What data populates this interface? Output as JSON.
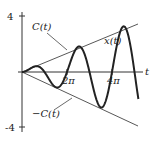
{
  "chart_data": {
    "type": "line",
    "title": "",
    "xlabel": "t",
    "ylabel": "",
    "xlim": [
      0,
      16.3
    ],
    "ylim": [
      -4,
      4
    ],
    "x_ticks": [
      {
        "value": 6.2832,
        "label": "2π"
      },
      {
        "value": 12.5664,
        "label": "4π"
      }
    ],
    "y_ticks": [
      {
        "value": 4,
        "label": "4"
      },
      {
        "value": -4,
        "label": "-4"
      }
    ],
    "grid": false,
    "legend": null,
    "series": [
      {
        "name": "x(t)",
        "formula": "x(t) = 0.23 t sin(t)",
        "style": "thick solid"
      },
      {
        "name": "C(t)",
        "formula": "C(t) = 0.23 t",
        "style": "thin solid"
      },
      {
        "name": "-C(t)",
        "formula": "-C(t) = -0.23 t",
        "style": "thin solid"
      }
    ],
    "annotations": [
      "C(t)",
      "x(t)",
      "-C(t)"
    ]
  },
  "labels": {
    "axis_t": "t",
    "y_top": "4",
    "y_bottom": "-4",
    "tick_2pi": "2π",
    "tick_4pi": "4π",
    "upper_envelope": "C(t)",
    "lower_envelope": "−C(t)",
    "curve": "x(t)"
  }
}
